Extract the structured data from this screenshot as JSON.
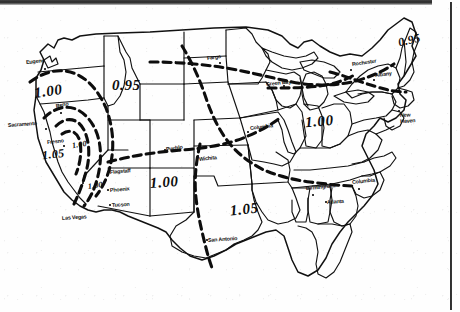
{
  "document": {
    "kind": "scanned-contour-map",
    "region": "Continental United States",
    "description": "Black and white scanned isoline map of the continental United States with dashed contour lines labelled 0.95, 1.00 and 1.05, annotated with reference city points."
  },
  "contour_values": [
    "0.95",
    "1.00",
    "1.05"
  ],
  "contour_labels": [
    {
      "id": "nw-100",
      "text": "1.00",
      "x": 34,
      "y": 84,
      "size": "big",
      "rotate": -8
    },
    {
      "id": "nw-095",
      "text": "0.95",
      "x": 112,
      "y": 78,
      "size": "big",
      "rotate": 0
    },
    {
      "id": "ca-105",
      "text": "1.05",
      "x": 42,
      "y": 148,
      "size": "mid",
      "rotate": -6
    },
    {
      "id": "ca-100-inner",
      "text": "1.00",
      "x": 72,
      "y": 141,
      "size": "sm",
      "rotate": -10
    },
    {
      "id": "az-100",
      "text": "1.00",
      "x": 88,
      "y": 182,
      "size": "sm",
      "rotate": -8
    },
    {
      "id": "sw-100",
      "text": "1.00",
      "x": 150,
      "y": 175,
      "size": "big",
      "rotate": -4
    },
    {
      "id": "tx-105",
      "text": "1.05",
      "x": 230,
      "y": 202,
      "size": "big",
      "rotate": -6
    },
    {
      "id": "mw-100",
      "text": "1.00",
      "x": 305,
      "y": 114,
      "size": "big",
      "rotate": -5
    },
    {
      "id": "ne-095",
      "text": "0.95",
      "x": 398,
      "y": 34,
      "size": "mid",
      "rotate": -14
    }
  ],
  "cities": [
    {
      "name": "Eugene",
      "x": 26,
      "y": 60,
      "dot_x": 44,
      "dot_y": 68,
      "rotate": -6,
      "lines": [
        "Eugene"
      ]
    },
    {
      "name": "Sacramento",
      "x": 8,
      "y": 123,
      "dot_x": 45,
      "dot_y": 128,
      "rotate": -4,
      "lines": [
        "Sacramento"
      ]
    },
    {
      "name": "Reno",
      "x": 56,
      "y": 104,
      "dot_x": 60,
      "dot_y": 112,
      "rotate": -12,
      "lines": [
        "Reno"
      ]
    },
    {
      "name": "Fresno",
      "x": 47,
      "y": 140,
      "dot_x": 63,
      "dot_y": 145,
      "rotate": -6,
      "lines": [
        "Fresno"
      ]
    },
    {
      "name": "Las Vegas",
      "x": 62,
      "y": 216,
      "dot_x": 82,
      "dot_y": 182,
      "rotate": -4,
      "lines": [
        "Las Vegas"
      ]
    },
    {
      "name": "Flagstaff",
      "x": 110,
      "y": 170,
      "dot_x": 107,
      "dot_y": 171,
      "rotate": -5,
      "lines": [
        "Flagstaff"
      ]
    },
    {
      "name": "Phoenix",
      "x": 110,
      "y": 188,
      "dot_x": 107,
      "dot_y": 189,
      "rotate": -5,
      "lines": [
        "Phoenix"
      ]
    },
    {
      "name": "Tucson",
      "x": 112,
      "y": 203,
      "dot_x": 109,
      "dot_y": 204,
      "rotate": -4,
      "lines": [
        "Tucson"
      ]
    },
    {
      "name": "Pueblo",
      "x": 166,
      "y": 147,
      "dot_x": 164,
      "dot_y": 149,
      "rotate": -8,
      "lines": [
        "Pueblo"
      ]
    },
    {
      "name": "Wichita",
      "x": 199,
      "y": 157,
      "dot_x": 197,
      "dot_y": 155,
      "rotate": -6,
      "lines": [
        "Wichita"
      ]
    },
    {
      "name": "San Antonio",
      "x": 208,
      "y": 238,
      "dot_x": 206,
      "dot_y": 239,
      "rotate": -4,
      "lines": [
        "San Antonio"
      ]
    },
    {
      "name": "Fargo",
      "x": 207,
      "y": 56,
      "dot_x": 219,
      "dot_y": 62,
      "rotate": -8,
      "lines": [
        "Fargo"
      ]
    },
    {
      "name": "Green Bay",
      "x": 266,
      "y": 82,
      "dot_x": 283,
      "dot_y": 85,
      "rotate": -6,
      "lines": [
        "Green Bay"
      ]
    },
    {
      "name": "Columbia MO",
      "x": 250,
      "y": 126,
      "dot_x": 247,
      "dot_y": 131,
      "rotate": -7,
      "lines": [
        "Columbia"
      ]
    },
    {
      "name": "Rochester",
      "x": 352,
      "y": 62,
      "dot_x": 350,
      "dot_y": 69,
      "rotate": -8,
      "lines": [
        "Rochester"
      ]
    },
    {
      "name": "Albany",
      "x": 375,
      "y": 73,
      "dot_x": 373,
      "dot_y": 79,
      "rotate": -7,
      "lines": [
        "Albany"
      ]
    },
    {
      "name": "New Haven",
      "x": 400,
      "y": 113,
      "dot_x": 398,
      "dot_y": 110,
      "rotate": -3,
      "lines": [
        "New",
        "Haven"
      ]
    },
    {
      "name": "Birmingham",
      "x": 306,
      "y": 186,
      "dot_x": 312,
      "dot_y": 194,
      "rotate": -5,
      "lines": [
        "Birmingham"
      ]
    },
    {
      "name": "Atlanta",
      "x": 327,
      "y": 200,
      "dot_x": 325,
      "dot_y": 201,
      "rotate": -4,
      "lines": [
        "Atlanta"
      ]
    },
    {
      "name": "Columbia SC",
      "x": 352,
      "y": 180,
      "dot_x": 358,
      "dot_y": 188,
      "rotate": -6,
      "lines": [
        "Columbia"
      ]
    }
  ],
  "legend_note": ""
}
